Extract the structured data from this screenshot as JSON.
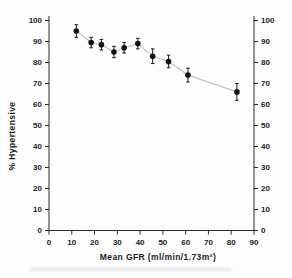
{
  "figure": {
    "kind": "scanned-journal-figure"
  },
  "colors": {
    "background": "#fdfdfd",
    "axis": "#2a2a2a",
    "text": "#1c1c1c",
    "marker": "#111111",
    "error_bar": "#1a1a1a",
    "connector_line": "#c3c3c3"
  },
  "chart_data": {
    "type": "scatter",
    "title": "",
    "xlabel": "Mean GFR (ml/min/1.73m²)",
    "ylabel": "% Hypertensive",
    "xlim": [
      0,
      90
    ],
    "ylim": [
      0,
      100
    ],
    "xticks": [
      0,
      10,
      20,
      30,
      40,
      50,
      60,
      70,
      80,
      90
    ],
    "yticks": [
      0,
      10,
      20,
      30,
      40,
      50,
      60,
      70,
      80,
      90,
      100
    ],
    "y_axis_mirrored_right": true,
    "grid": false,
    "legend": "none",
    "marker_style": "filled-circle-with-vertical-error-bars",
    "connector": "light-gray-line",
    "series": [
      {
        "name": "% Hypertensive vs Mean GFR",
        "x": [
          12,
          18.5,
          23,
          28.5,
          33,
          39,
          45.5,
          52.5,
          61,
          82.5
        ],
        "y": [
          95,
          89.5,
          88.5,
          85,
          87,
          89,
          83,
          80.5,
          74,
          66
        ],
        "yerr": [
          3,
          2.5,
          2.5,
          2.7,
          2.5,
          2.5,
          3.5,
          3,
          3.3,
          4
        ]
      }
    ]
  }
}
